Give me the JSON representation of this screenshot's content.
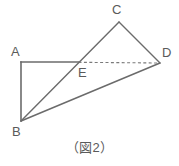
{
  "figure": {
    "caption": "（図2）",
    "stroke_color": "#6b6b6b",
    "dashed_color": "#7a7a7a",
    "label_color": "#5a5a5a",
    "background_color": "#ffffff",
    "stroke_width": 1.4,
    "vertices": [
      {
        "id": "A",
        "label": "A",
        "x": 21,
        "y": 62,
        "label_x": 11,
        "label_y": 45
      },
      {
        "id": "B",
        "label": "B",
        "x": 21,
        "y": 121,
        "label_x": 12,
        "label_y": 125
      },
      {
        "id": "C",
        "label": "C",
        "x": 119,
        "y": 22,
        "label_x": 112,
        "label_y": 3
      },
      {
        "id": "D",
        "label": "D",
        "x": 160,
        "y": 63,
        "label_x": 162,
        "label_y": 46
      },
      {
        "id": "E",
        "label": "E",
        "x": 78,
        "y": 62,
        "label_x": 78,
        "label_y": 66
      }
    ],
    "segments": [
      {
        "name": "segment-A-E",
        "from": "A",
        "to": "E",
        "style": "solid",
        "x1": 21,
        "y1": 62,
        "x2": 78,
        "y2": 62
      },
      {
        "name": "segment-E-D",
        "from": "E",
        "to": "D",
        "style": "dashed",
        "x1": 78,
        "y1": 62,
        "x2": 160,
        "y2": 63
      },
      {
        "name": "segment-A-B",
        "from": "A",
        "to": "B",
        "style": "solid",
        "x1": 21,
        "y1": 62,
        "x2": 21,
        "y2": 121
      },
      {
        "name": "segment-B-C",
        "from": "B",
        "to": "C",
        "style": "solid",
        "x1": 21,
        "y1": 121,
        "x2": 119,
        "y2": 22
      },
      {
        "name": "segment-B-D",
        "from": "B",
        "to": "D",
        "style": "solid",
        "x1": 21,
        "y1": 121,
        "x2": 160,
        "y2": 63
      },
      {
        "name": "segment-C-D",
        "from": "C",
        "to": "D",
        "style": "solid",
        "x1": 119,
        "y1": 22,
        "x2": 160,
        "y2": 63
      }
    ]
  }
}
